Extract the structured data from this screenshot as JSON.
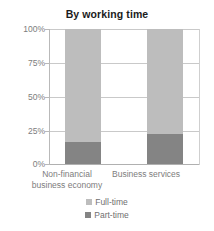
{
  "chart_data": {
    "type": "bar",
    "title": "By working time",
    "xlabel": "",
    "ylabel": "",
    "ylim": [
      0,
      100
    ],
    "stacked": true,
    "grid": true,
    "legend_position": "bottom",
    "categories": [
      "Non-financial business economy",
      "Business services"
    ],
    "category_lines": [
      [
        "Non-financial",
        "business economy"
      ],
      [
        "Business services"
      ]
    ],
    "ticklabels": [
      "100%",
      "75%",
      "50%",
      "25%",
      "0%"
    ],
    "tickvalues": [
      100,
      75,
      50,
      25,
      0
    ],
    "series": [
      {
        "name": "Full-time",
        "values": [
          84,
          78
        ],
        "color": "#bdbdbd"
      },
      {
        "name": "Part-time",
        "values": [
          16,
          22
        ],
        "color": "#848484"
      }
    ]
  },
  "title": {
    "text": "By working time"
  },
  "axis": {
    "y": {
      "t100": "100%",
      "t75": "75%",
      "t50": "50%",
      "t25": "25%",
      "t0": "0%"
    },
    "x": {
      "cat0_line1": "Non-financial",
      "cat0_line2": "business economy",
      "cat1_line1": "Business services"
    }
  },
  "legend": {
    "items": [
      {
        "label": "Full-time",
        "color": "#bdbdbd"
      },
      {
        "label": "Part-time",
        "color": "#848484"
      }
    ]
  },
  "colors": {
    "full_time": "#bdbdbd",
    "part_time": "#848484",
    "gridline": "#c9c9c9",
    "text": "#7d7d7d",
    "title": "#1b1b1b",
    "background": "#ffffff"
  }
}
